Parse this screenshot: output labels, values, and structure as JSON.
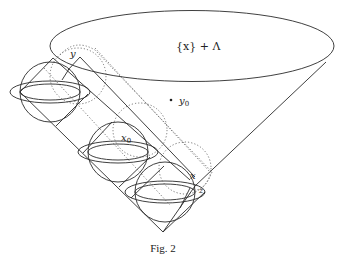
{
  "figure": {
    "caption": "Fig. 2",
    "labels": {
      "set": "{x} + Λ",
      "y": "y",
      "y0_base": "y",
      "y0_sub": "0",
      "x0_base": "x",
      "x0_sub": "0",
      "x": "x",
      "z": "z"
    },
    "colors": {
      "stroke": "#2a2a2a",
      "dotted": "#555555",
      "background": "#ffffff"
    },
    "elements": [
      "cone-top-ellipse",
      "cone-left-edge",
      "cone-right-edge",
      "diagonal-band-rectangle",
      "inner-band-rectangle",
      "dotted-band-rectangle",
      "sphere-top",
      "sphere-middle",
      "sphere-bottom",
      "dotted-sphere-top",
      "dotted-sphere-middle",
      "dotted-sphere-bottom",
      "point-y0"
    ]
  }
}
